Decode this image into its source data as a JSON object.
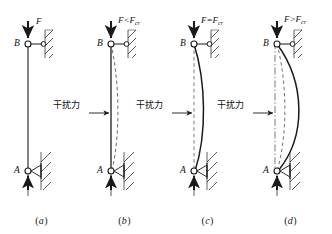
{
  "figure": {
    "background_color": "#ffffff",
    "line_color": "#1a1a1a",
    "panel_count": 4
  },
  "labels": {
    "disturbing_force": "干扰力",
    "node_top": "B",
    "node_bottom": "A"
  },
  "panels": [
    {
      "id": "a",
      "caption": "(a)",
      "force_label": "F",
      "force_sub": "",
      "has_disturbing_force": false,
      "state": "straight-unloaded",
      "column_style": "solid-straight",
      "curves": [
        "solid-straight"
      ]
    },
    {
      "id": "b",
      "caption": "(b)",
      "force_label": "F<F",
      "force_sub": "cr",
      "has_disturbing_force": true,
      "state": "stable-small-deflection-returns",
      "column_style": "solid-straight",
      "curves": [
        "solid-straight",
        "dashed-small-bulge"
      ]
    },
    {
      "id": "c",
      "caption": "(c)",
      "force_label": "F=F",
      "force_sub": "cr",
      "has_disturbing_force": true,
      "state": "critical-neutral-equilibrium",
      "column_style": "solid-curved",
      "curves": [
        "dashed-straight-reference",
        "solid-medium-bulge"
      ]
    },
    {
      "id": "d",
      "caption": "(d)",
      "force_label": "F>F",
      "force_sub": "cr",
      "has_disturbing_force": true,
      "state": "unstable-large-deflection",
      "column_style": "solid-curved-large",
      "curves": [
        "dashdot-straight-reference",
        "dashed-medium-bulge",
        "solid-large-bulge"
      ]
    }
  ],
  "supports": {
    "top": {
      "type": "roller-link-to-wall",
      "node": "B",
      "description": "pinned circle connected by horizontal link to hatched fixed wall"
    },
    "bottom": {
      "type": "pin-support",
      "node": "A",
      "description": "pinned circle with triangle bearing on hatched fixed wall"
    }
  },
  "arrows": {
    "top_load": "downward axial load arrow at B",
    "bottom_reaction": "upward reaction arrow at A",
    "lateral": "rightward horizontal disturbing force arrow at mid-height"
  }
}
